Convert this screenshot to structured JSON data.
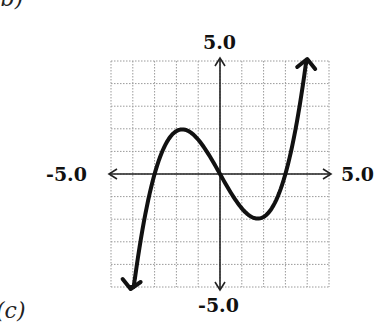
{
  "panel_labels": {
    "top": "(b)",
    "bottom": "(c)"
  },
  "chart_data": {
    "type": "line",
    "title": "",
    "xlabel": "",
    "ylabel": "",
    "xlim": [
      -5.0,
      5.0
    ],
    "ylim": [
      -5.0,
      5.0
    ],
    "grid": true,
    "grid_step": 1,
    "tick_labels": {
      "x_min": "-5.0",
      "x_max": "5.0",
      "y_min": "-5.0",
      "y_max": "5.0"
    },
    "axes_arrows": true,
    "legend": [],
    "series": [
      {
        "name": "f(x)",
        "x": [
          -4.1,
          -3.5,
          -3.0,
          -2.5,
          -2.0,
          -1.7,
          -1.0,
          -0.5,
          0.0,
          0.5,
          1.0,
          1.7,
          2.0,
          2.5,
          3.0,
          3.5,
          4.0
        ],
        "values": [
          -5.0,
          -2.2,
          0.0,
          1.3,
          1.9,
          2.0,
          1.5,
          0.8,
          0.0,
          -0.8,
          -1.5,
          -2.0,
          -1.9,
          -1.3,
          0.0,
          2.2,
          5.0
        ]
      }
    ],
    "key_points": {
      "zeros": [
        -3,
        0,
        3
      ],
      "local_max": [
        -1.7,
        2.0
      ],
      "local_min": [
        1.7,
        -2.0
      ]
    },
    "colors": {
      "curve": "#111111",
      "grid": "#9a9a9a",
      "axes": "#222222"
    }
  }
}
